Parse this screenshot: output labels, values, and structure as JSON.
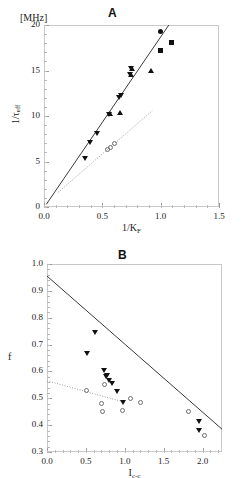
{
  "figure": {
    "panels": [
      {
        "letter": "A",
        "unit_label": "[MHz]",
        "xlabel_main": "1/K",
        "xlabel_sub": "F",
        "ylabel_main": "1/τ",
        "ylabel_sub": "eff",
        "x_ticklabels": [
          "0.0",
          "0.5",
          "1.0",
          "1.5"
        ],
        "y_ticklabels": [
          "0",
          "5",
          "10",
          "15",
          "20"
        ]
      },
      {
        "letter": "B",
        "unit_label": "",
        "xlabel_main": "I",
        "xlabel_sub": "c-c",
        "ylabel_main": "f",
        "ylabel_sub": "",
        "x_ticklabels": [
          "0.0",
          "0.5",
          "1.0",
          "1.5",
          "2.0"
        ],
        "y_ticklabels": [
          "0.3",
          "0.4",
          "0.5",
          "0.6",
          "0.7",
          "0.8",
          "0.9",
          "1.0"
        ]
      }
    ]
  },
  "chart_data": [
    {
      "type": "scatter",
      "panel": "A",
      "title": "A",
      "xlabel": "1/K_F",
      "ylabel": "1/tau_eff",
      "unit": "[MHz]",
      "xlim": [
        0.0,
        1.5
      ],
      "ylim": [
        0,
        20
      ],
      "xticks": [
        0.0,
        0.5,
        1.0,
        1.5
      ],
      "yticks": [
        0,
        5,
        10,
        15,
        20
      ],
      "xminor_step": 0.1,
      "yminor_step": 1,
      "grid": false,
      "legend": "none",
      "series": [
        {
          "name": "filled-down-triangles",
          "marker": "tri-down",
          "filled": true,
          "points": [
            [
              0.355,
              5.3
            ],
            [
              0.395,
              7.1
            ],
            [
              0.455,
              8.1
            ],
            [
              0.555,
              10.2
            ],
            [
              0.645,
              12.0
            ],
            [
              0.66,
              12.25
            ],
            [
              0.735,
              14.55
            ],
            [
              0.745,
              15.2
            ]
          ]
        },
        {
          "name": "filled-up-triangles",
          "marker": "tri-up",
          "filled": true,
          "points": [
            [
              0.565,
              10.25
            ],
            [
              0.65,
              10.4
            ],
            [
              0.745,
              14.55
            ],
            [
              0.75,
              15.2
            ],
            [
              0.915,
              14.95
            ]
          ]
        },
        {
          "name": "filled-circles",
          "marker": "circle",
          "filled": true,
          "points": [
            [
              0.995,
              19.25
            ],
            [
              1.0,
              17.2
            ]
          ]
        },
        {
          "name": "filled-squares",
          "marker": "square",
          "filled": true,
          "points": [
            [
              1.095,
              18.05
            ],
            [
              1.0,
              17.2
            ]
          ]
        },
        {
          "name": "open-circles",
          "marker": "circle-open",
          "filled": false,
          "points": [
            [
              0.545,
              6.3
            ],
            [
              0.57,
              6.5
            ],
            [
              0.6,
              7.0
            ]
          ]
        }
      ],
      "fits": [
        {
          "name": "solid-fit",
          "style": "solid",
          "x": [
            0.02,
            1.07
          ],
          "y": [
            0.3,
            20.0
          ]
        },
        {
          "name": "dotted-fit",
          "style": "dotted",
          "x": [
            0.12,
            0.93
          ],
          "y": [
            1.6,
            10.6
          ]
        }
      ]
    },
    {
      "type": "scatter",
      "panel": "B",
      "title": "B",
      "xlabel": "I_c-c",
      "ylabel": "f",
      "unit": "",
      "xlim": [
        0.0,
        2.25
      ],
      "ylim": [
        0.3,
        1.0
      ],
      "xticks": [
        0.0,
        0.5,
        1.0,
        1.5,
        2.0
      ],
      "yticks": [
        0.3,
        0.4,
        0.5,
        0.6,
        0.7,
        0.8,
        0.9,
        1.0
      ],
      "xminor_step": 0.1,
      "yminor_step": 0.02,
      "grid": false,
      "legend": "none",
      "series": [
        {
          "name": "filled-down-triangles",
          "marker": "tri-down",
          "filled": true,
          "points": [
            [
              0.51,
              0.665
            ],
            [
              0.615,
              0.745
            ],
            [
              0.735,
              0.605
            ],
            [
              0.755,
              0.58
            ],
            [
              0.775,
              0.585
            ],
            [
              0.8,
              0.565
            ],
            [
              0.835,
              0.555
            ],
            [
              0.9,
              0.525
            ],
            [
              0.975,
              0.485
            ],
            [
              1.955,
              0.415
            ],
            [
              1.955,
              0.38
            ]
          ]
        },
        {
          "name": "open-circles",
          "marker": "circle-open",
          "filled": false,
          "points": [
            [
              0.51,
              0.53
            ],
            [
              0.705,
              0.48
            ],
            [
              0.715,
              0.45
            ],
            [
              0.745,
              0.55
            ],
            [
              0.975,
              0.455
            ],
            [
              1.075,
              0.5
            ],
            [
              1.205,
              0.485
            ],
            [
              1.82,
              0.45
            ],
            [
              2.02,
              0.36
            ]
          ]
        }
      ],
      "fits": [
        {
          "name": "solid-fit",
          "style": "solid",
          "x": [
            0.0,
            2.25
          ],
          "y": [
            0.955,
            0.385
          ]
        },
        {
          "name": "dotted-fit",
          "style": "dotted",
          "x": [
            0.0,
            1.0
          ],
          "y": [
            0.565,
            0.485
          ]
        }
      ]
    }
  ]
}
